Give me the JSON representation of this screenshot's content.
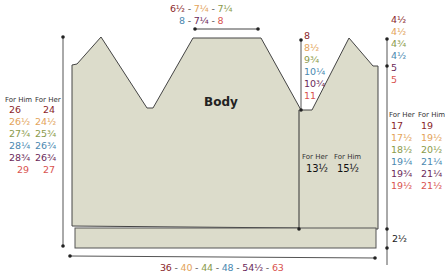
{
  "colors": {
    "size1": "#8a1f2a",
    "size2": "#e3a35a",
    "size3": "#8a9a4a",
    "size4": "#4a88b0",
    "size5": "#6b2a5a",
    "size6": "#d9534f",
    "panel_fill": "#dcdccb",
    "outline": "#444444"
  },
  "piece": {
    "title": "Body"
  },
  "top_width": {
    "row1": [
      "6½",
      "7¼",
      "7¼"
    ],
    "row2": [
      "8",
      "7¼",
      "8"
    ],
    "separator": " - "
  },
  "bottom_width": {
    "values": [
      "36",
      "40",
      "44",
      "48",
      "54½",
      "63"
    ],
    "separator": " - "
  },
  "left_length": {
    "headers": [
      "For Him",
      "For Her"
    ],
    "him": [
      "26",
      "26½",
      "27¾",
      "28¼",
      "28¾",
      "29"
    ],
    "her": [
      "24",
      "24½",
      "25¾",
      "26¾",
      "26¾",
      "27"
    ]
  },
  "neck_depth": {
    "values": [
      "8",
      "8½",
      "9¾",
      "10¼",
      "10¾",
      "11"
    ]
  },
  "shoulder_drop": {
    "values": [
      "4½",
      "4½",
      "4¾",
      "4½",
      "5",
      "5"
    ]
  },
  "right_length": {
    "headers": [
      "For Her",
      "For Him"
    ],
    "her": [
      "17",
      "17½",
      "18½",
      "19¼",
      "19¾",
      "19½"
    ],
    "him": [
      "19",
      "19½",
      "20½",
      "21¼",
      "21¼",
      "21½"
    ]
  },
  "armhole_inner": {
    "headers": [
      "For Her",
      "For Him"
    ],
    "her": "13½",
    "him": "15½"
  },
  "ribbing": {
    "value": "2½"
  }
}
